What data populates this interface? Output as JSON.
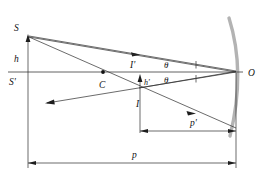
{
  "diagram": {
    "background_color": "#ffffff",
    "mirror_color": "#b3b3b3",
    "line_color": "#2b2b2b",
    "labels": {
      "source_point": "S",
      "source_axis_point": "S'",
      "object_height": "h",
      "center_of_curvature": "C",
      "image_above_axis": "I'",
      "image_height": "h'",
      "image_point": "I",
      "angle_upper": "θ",
      "angle_lower": "θ",
      "vertex_point": "O",
      "image_distance": "p'",
      "object_distance": "p"
    }
  },
  "geometry": {
    "axis_y": 72,
    "source_x": 28,
    "source_y": 35,
    "center_x": 103,
    "image_x": 140,
    "image_y": 95,
    "vertex_x": 237,
    "vertex_y": 72,
    "mirror_top_x": 229,
    "mirror_top_y": 18,
    "mirror_bottom_x": 230,
    "mirror_bottom_y": 135,
    "dim_p_y": 163,
    "dim_pprime_y": 131
  }
}
